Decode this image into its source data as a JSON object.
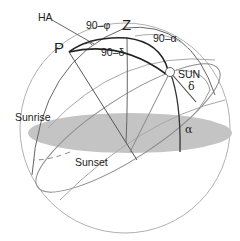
{
  "diagram": {
    "colors": {
      "horizon_fill": "#c4c4c4",
      "thin_line": "#9a9a9a",
      "dark_line": "#333333",
      "background": "#ffffff"
    },
    "labels": {
      "ha": "HA",
      "pole": "P",
      "zenith": "Z",
      "sun": "SUN",
      "colatitude": "90–φ",
      "codeclination": "90–δ",
      "coaltitude": "90–α",
      "declination": "δ",
      "altitude": "α",
      "sunrise": "Sunrise",
      "sunset": "Sunset"
    },
    "nodes": [
      {
        "id": "P",
        "label": "P",
        "x": 69,
        "y": 52
      },
      {
        "id": "Z",
        "label": "Z",
        "x": 127,
        "y": 38
      },
      {
        "id": "SUN",
        "label": "SUN",
        "x": 170,
        "y": 72
      }
    ],
    "edges": [
      {
        "from": "P",
        "to": "Z",
        "label": "90–φ"
      },
      {
        "from": "P",
        "to": "SUN",
        "label": "90–δ"
      },
      {
        "from": "Z",
        "to": "SUN",
        "label": "90–α"
      }
    ]
  }
}
